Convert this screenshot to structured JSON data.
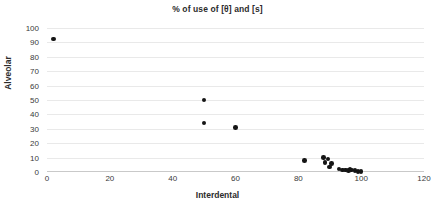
{
  "chart_data": {
    "type": "scatter",
    "title": "% of use of [θ] and [s]",
    "xlabel": "Interdental",
    "ylabel": "Alveolar",
    "xlim": [
      0,
      120
    ],
    "ylim": [
      0,
      100
    ],
    "xticks": [
      0,
      20,
      40,
      60,
      80,
      100,
      120
    ],
    "yticks": [
      0,
      10,
      20,
      30,
      40,
      50,
      60,
      70,
      80,
      90,
      100
    ],
    "grid": "horizontal",
    "legend": "none",
    "marker_color": "#151515",
    "gridline_color": "#e9e9e9",
    "axis_color": "#c9c9c9",
    "series": [
      {
        "name": "speakers",
        "points": [
          [
            2,
            92.5
          ],
          [
            50,
            50
          ],
          [
            50,
            34
          ],
          [
            60,
            31
          ],
          [
            82,
            8
          ],
          [
            88,
            10
          ],
          [
            88.5,
            6.5
          ],
          [
            89.5,
            9
          ],
          [
            90,
            3.5
          ],
          [
            90.5,
            6
          ],
          [
            93,
            2
          ],
          [
            94,
            1.5
          ],
          [
            95,
            1.5
          ],
          [
            96,
            1
          ],
          [
            96.5,
            2
          ],
          [
            97,
            1.5
          ],
          [
            98,
            1
          ],
          [
            99,
            0.5
          ],
          [
            100,
            0.5
          ]
        ]
      }
    ]
  }
}
